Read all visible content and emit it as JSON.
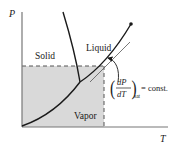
{
  "diagram": {
    "axes": {
      "y_label": "P",
      "x_label": "T"
    },
    "regions": {
      "solid": "Solid",
      "liquid": "Liquid",
      "vapor": "Vapor"
    },
    "annotation": {
      "numerator": "dP",
      "denominator": "dT",
      "subscript": "sat",
      "suffix": "= const."
    },
    "colors": {
      "line": "#1a1a1a",
      "shade": "#d9d9d9",
      "dash": "#555555",
      "axis": "#777777"
    }
  }
}
